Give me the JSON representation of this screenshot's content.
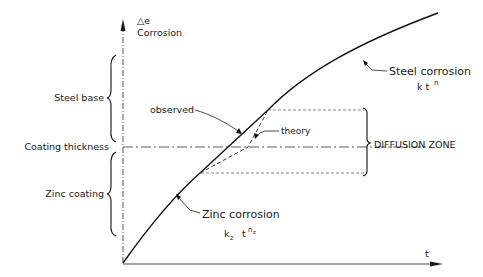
{
  "diagram": {
    "y_axis": {
      "symbol": "△e",
      "label": "Corrosion"
    },
    "x_axis": {
      "label": "t"
    },
    "left_labels": {
      "steel_base": "Steel base",
      "coating_thickness": "Coating thickness",
      "zinc_coating": "Zinc coating"
    },
    "annotations": {
      "observed": "observed",
      "theory": "theory",
      "diffusion_zone": "DIFFUSION  ZONE",
      "steel_corrosion": "Steel corrosion",
      "steel_formula_k": "k t",
      "steel_formula_exp": "n",
      "zinc_corrosion": "Zinc  corrosion",
      "zinc_formula_k": "k",
      "zinc_formula_ksub": "z",
      "zinc_formula_t": "t",
      "zinc_formula_exp": "n",
      "zinc_formula_expsub": "z"
    },
    "colors": {
      "ink": "#1a1a1a",
      "background": "#ffffff"
    }
  }
}
